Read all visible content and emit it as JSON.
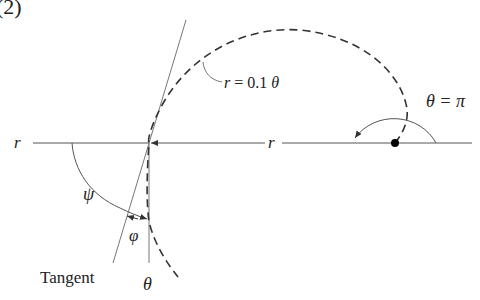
{
  "figure": {
    "panel_label": "(2)"
  },
  "labels": {
    "r_left": "r",
    "r_middle": "r",
    "spiral_equation": "r = 0.1 θ",
    "theta_pi": "θ = π",
    "psi": "ψ",
    "phi": "φ",
    "theta_bottom": "θ",
    "tangent": "Tangent"
  },
  "colors": {
    "curve": "#333333",
    "lines": "#555555",
    "text": "#222222",
    "dot": "#000000"
  }
}
